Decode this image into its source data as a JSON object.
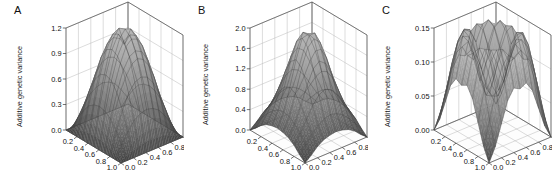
{
  "figure": {
    "background": "#ffffff",
    "panel_count": 3
  },
  "panels": [
    {
      "label": "A",
      "zlabel": "Additive genetic variance",
      "zticks": [
        "0.0",
        "0.3",
        "0.6",
        "0.9",
        "1.2"
      ],
      "xticks": [
        "0.2",
        "0.4",
        "0.6",
        "0.8",
        "1.0"
      ],
      "yticks": [
        "0.0",
        "0.2",
        "0.4",
        "0.6",
        "0.8",
        "1.0"
      ]
    },
    {
      "label": "B",
      "zlabel": "Additive genetic variance",
      "zticks": [
        "0.0",
        "0.4",
        "0.8",
        "1.2",
        "1.6",
        "2.0"
      ],
      "xticks": [
        "0.2",
        "0.4",
        "0.6",
        "0.8",
        "1.0"
      ],
      "yticks": [
        "0.0",
        "0.2",
        "0.4",
        "0.6",
        "0.8",
        "1.0"
      ]
    },
    {
      "label": "C",
      "zlabel": "Additive genetic variance",
      "zticks": [
        "0.00",
        "0.05",
        "0.10",
        "0.15"
      ],
      "xticks": [
        "0.2",
        "0.4",
        "0.6",
        "0.8",
        "1.0"
      ],
      "yticks": [
        "0.0",
        "0.2",
        "0.4",
        "0.6",
        "0.8",
        "1.0"
      ]
    }
  ],
  "chart_data": [
    {
      "type": "surface",
      "panel": "A",
      "title": "A",
      "xlabel": "",
      "ylabel": "",
      "zlabel": "Additive genetic variance",
      "xlim": [
        0.0,
        1.0
      ],
      "ylim": [
        0.0,
        1.0
      ],
      "zlim": [
        0.0,
        1.2
      ],
      "xticks": [
        0.2,
        0.4,
        0.6,
        0.8,
        1.0
      ],
      "yticks": [
        0.0,
        0.2,
        0.4,
        0.6,
        0.8,
        1.0
      ],
      "zticks": [
        0.0,
        0.3,
        0.6,
        0.9,
        1.2
      ],
      "grid": true,
      "colormap": "gray",
      "shape": "single central dome, peak ~1.05 at p=q=0.5, falling to 0 at all four corners",
      "surface_formula": "z = 4.2 * p*(1-p) * q*(1-q) scaled to peak 1.05",
      "x": [
        0.0,
        0.1,
        0.2,
        0.3,
        0.4,
        0.5,
        0.6,
        0.7,
        0.8,
        0.9,
        1.0
      ],
      "y": [
        0.0,
        0.1,
        0.2,
        0.3,
        0.4,
        0.5,
        0.6,
        0.7,
        0.8,
        0.9,
        1.0
      ],
      "z": [
        [
          0.0,
          0.0,
          0.0,
          0.0,
          0.0,
          0.0,
          0.0,
          0.0,
          0.0,
          0.0,
          0.0
        ],
        [
          0.0,
          0.15,
          0.27,
          0.37,
          0.42,
          0.44,
          0.42,
          0.37,
          0.27,
          0.15,
          0.0
        ],
        [
          0.0,
          0.27,
          0.48,
          0.65,
          0.75,
          0.78,
          0.75,
          0.65,
          0.48,
          0.27,
          0.0
        ],
        [
          0.0,
          0.37,
          0.65,
          0.88,
          1.01,
          1.05,
          1.01,
          0.88,
          0.65,
          0.37,
          0.0
        ],
        [
          0.0,
          0.42,
          0.75,
          1.01,
          1.16,
          1.2,
          1.16,
          1.01,
          0.75,
          0.42,
          0.0
        ],
        [
          0.0,
          0.44,
          0.78,
          1.05,
          1.2,
          1.05,
          1.2,
          1.05,
          0.78,
          0.44,
          0.0
        ],
        [
          0.0,
          0.42,
          0.75,
          1.01,
          1.16,
          1.2,
          1.16,
          1.01,
          0.75,
          0.42,
          0.0
        ],
        [
          0.0,
          0.37,
          0.65,
          0.88,
          1.01,
          1.05,
          1.01,
          0.88,
          0.65,
          0.37,
          0.0
        ],
        [
          0.0,
          0.27,
          0.48,
          0.65,
          0.75,
          0.78,
          0.75,
          0.65,
          0.48,
          0.27,
          0.0
        ],
        [
          0.0,
          0.15,
          0.27,
          0.37,
          0.42,
          0.44,
          0.42,
          0.37,
          0.27,
          0.15,
          0.0
        ],
        [
          0.0,
          0.0,
          0.0,
          0.0,
          0.0,
          0.0,
          0.0,
          0.0,
          0.0,
          0.0,
          0.0
        ]
      ]
    },
    {
      "type": "surface",
      "panel": "B",
      "title": "B",
      "xlabel": "",
      "ylabel": "",
      "zlabel": "Additive genetic variance",
      "xlim": [
        0.0,
        1.0
      ],
      "ylim": [
        0.0,
        1.0
      ],
      "zlim": [
        0.0,
        2.0
      ],
      "xticks": [
        0.2,
        0.4,
        0.6,
        0.8,
        1.0
      ],
      "yticks": [
        0.0,
        0.2,
        0.4,
        0.6,
        0.8,
        1.0
      ],
      "zticks": [
        0.0,
        0.4,
        0.8,
        1.2,
        1.6,
        2.0
      ],
      "grid": true,
      "colormap": "gray",
      "shape": "sharp central peak ~1.95 at p=q=0.5 with ridges along diagonals and small secondary lobes near mid-edges, zero at corners",
      "x": [
        0.0,
        0.1,
        0.2,
        0.3,
        0.4,
        0.5,
        0.6,
        0.7,
        0.8,
        0.9,
        1.0
      ],
      "y": [
        0.0,
        0.1,
        0.2,
        0.3,
        0.4,
        0.5,
        0.6,
        0.7,
        0.8,
        0.9,
        1.0
      ],
      "z": [
        [
          0.0,
          0.1,
          0.22,
          0.3,
          0.34,
          0.36,
          0.34,
          0.3,
          0.22,
          0.1,
          0.0
        ],
        [
          0.1,
          0.25,
          0.4,
          0.52,
          0.6,
          0.63,
          0.6,
          0.52,
          0.4,
          0.25,
          0.1
        ],
        [
          0.22,
          0.4,
          0.62,
          0.84,
          1.0,
          1.06,
          1.0,
          0.84,
          0.62,
          0.4,
          0.22
        ],
        [
          0.3,
          0.52,
          0.84,
          1.18,
          1.45,
          1.55,
          1.45,
          1.18,
          0.84,
          0.52,
          0.3
        ],
        [
          0.34,
          0.6,
          1.0,
          1.45,
          1.8,
          1.92,
          1.8,
          1.45,
          1.0,
          0.6,
          0.34
        ],
        [
          0.36,
          0.63,
          1.06,
          1.55,
          1.92,
          1.95,
          1.92,
          1.55,
          1.06,
          0.63,
          0.36
        ],
        [
          0.34,
          0.6,
          1.0,
          1.45,
          1.8,
          1.92,
          1.8,
          1.45,
          1.0,
          0.6,
          0.34
        ],
        [
          0.3,
          0.52,
          0.84,
          1.18,
          1.45,
          1.55,
          1.45,
          1.18,
          0.84,
          0.52,
          0.3
        ],
        [
          0.22,
          0.4,
          0.62,
          0.84,
          1.0,
          1.06,
          1.0,
          0.84,
          0.62,
          0.4,
          0.22
        ],
        [
          0.1,
          0.25,
          0.4,
          0.52,
          0.6,
          0.63,
          0.6,
          0.52,
          0.4,
          0.25,
          0.1
        ],
        [
          0.0,
          0.1,
          0.22,
          0.3,
          0.34,
          0.36,
          0.34,
          0.3,
          0.22,
          0.1,
          0.0
        ]
      ]
    },
    {
      "type": "surface",
      "panel": "C",
      "title": "C",
      "xlabel": "",
      "ylabel": "",
      "zlabel": "Additive genetic variance",
      "xlim": [
        0.0,
        1.0
      ],
      "ylim": [
        0.0,
        1.0
      ],
      "zlim": [
        0.0,
        0.15
      ],
      "xticks": [
        0.2,
        0.4,
        0.6,
        0.8,
        1.0
      ],
      "yticks": [
        0.0,
        0.2,
        0.4,
        0.6,
        0.8,
        1.0
      ],
      "zticks": [
        0.0,
        0.05,
        0.1,
        0.15
      ],
      "grid": true,
      "colormap": "gray",
      "shape": "four symmetric peaks ~0.145 with a saddle/depression ~0.055 at the centre and sharp drops to 0 at the corners",
      "x": [
        0.0,
        0.1,
        0.2,
        0.3,
        0.4,
        0.5,
        0.6,
        0.7,
        0.8,
        0.9,
        1.0
      ],
      "y": [
        0.0,
        0.1,
        0.2,
        0.3,
        0.4,
        0.5,
        0.6,
        0.7,
        0.8,
        0.9,
        1.0
      ],
      "z": [
        [
          0.0,
          0.02,
          0.05,
          0.08,
          0.095,
          0.09,
          0.095,
          0.08,
          0.05,
          0.02,
          0.0
        ],
        [
          0.02,
          0.055,
          0.095,
          0.125,
          0.138,
          0.13,
          0.138,
          0.125,
          0.095,
          0.055,
          0.02
        ],
        [
          0.05,
          0.095,
          0.13,
          0.145,
          0.142,
          0.12,
          0.142,
          0.145,
          0.13,
          0.095,
          0.05
        ],
        [
          0.08,
          0.125,
          0.145,
          0.14,
          0.115,
          0.085,
          0.115,
          0.14,
          0.145,
          0.125,
          0.08
        ],
        [
          0.095,
          0.138,
          0.142,
          0.115,
          0.08,
          0.06,
          0.08,
          0.115,
          0.142,
          0.138,
          0.095
        ],
        [
          0.09,
          0.13,
          0.12,
          0.085,
          0.06,
          0.055,
          0.06,
          0.085,
          0.12,
          0.13,
          0.09
        ],
        [
          0.095,
          0.138,
          0.142,
          0.115,
          0.08,
          0.06,
          0.08,
          0.115,
          0.142,
          0.138,
          0.095
        ],
        [
          0.08,
          0.125,
          0.145,
          0.14,
          0.115,
          0.085,
          0.115,
          0.14,
          0.145,
          0.125,
          0.08
        ],
        [
          0.05,
          0.095,
          0.13,
          0.145,
          0.142,
          0.12,
          0.142,
          0.145,
          0.13,
          0.095,
          0.05
        ],
        [
          0.02,
          0.055,
          0.095,
          0.125,
          0.138,
          0.13,
          0.138,
          0.125,
          0.095,
          0.055,
          0.02
        ],
        [
          0.0,
          0.02,
          0.05,
          0.08,
          0.095,
          0.09,
          0.095,
          0.08,
          0.05,
          0.02,
          0.0
        ]
      ]
    }
  ]
}
